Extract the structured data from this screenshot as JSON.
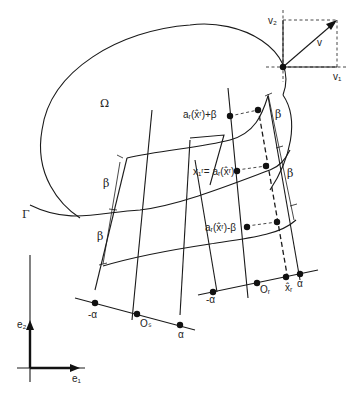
{
  "figure": {
    "domain_label": "Ω",
    "boundary_label": "Γ",
    "basis": {
      "e1": "e₁",
      "e2": "e₂"
    },
    "vector_inset": {
      "v": "v",
      "v1": "v₁",
      "v2": "v₂"
    },
    "labels": {
      "upper_point": "aᵣ(x̂ʳ)+β",
      "mid_point": "x₁ʳ= aᵣ(x̂ʳ)",
      "lower_point": "aᵣ(x̂ʳ)-β",
      "beta": "β",
      "origin_s": "Oₛ",
      "origin_r": "Oᵣ",
      "x_hat_r": "x̂ᵣ",
      "minus_alpha": "-α",
      "alpha": "α"
    },
    "colors": {
      "ink": "#1a1a1a",
      "background": "#ffffff"
    }
  }
}
